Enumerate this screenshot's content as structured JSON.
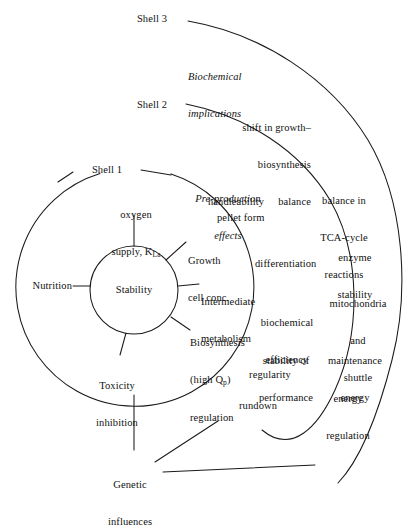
{
  "diagram": {
    "type": "concentric-shell-diagram",
    "stroke_color": "#1a1a1a",
    "background_color": "#ffffff",
    "core": {
      "label": "Stability"
    },
    "shells": [
      {
        "name": "shell-1",
        "label": "Shell 1"
      },
      {
        "name": "shell-2",
        "label": "Shell 2"
      },
      {
        "name": "shell-3",
        "label": "Shell 3"
      }
    ],
    "shell_titles": [
      {
        "name": "pre-production-effects",
        "line1": "Pre-production",
        "line2": "effects",
        "italic": true
      },
      {
        "name": "biochemical-implications",
        "line1": "Biochemical",
        "line2": "implications",
        "italic": true
      }
    ],
    "core_spokes": [
      {
        "name": "oxygen-supply",
        "line1": "oxygen",
        "line2": "supply, K",
        "sub": "La"
      },
      {
        "name": "growth-cell-conc",
        "line1": "Growth",
        "line2": "cell conc."
      },
      {
        "name": "intermediate-metabolism",
        "line1": "Intermediate",
        "line2": "metabolism"
      },
      {
        "name": "biosynthesis-regulation",
        "line1": "Biosynthesis",
        "line2": "(high Q",
        "sub": "p",
        "line2b": ")",
        "line3": "regulation"
      },
      {
        "name": "toxicity-inhibition",
        "line1": "Toxicity",
        "line2": "inhibition"
      },
      {
        "name": "nutrition",
        "line1": "Nutrition"
      },
      {
        "name": "genetic-influences",
        "line1": "Genetic",
        "line2": "influences"
      }
    ],
    "shell1_items": [
      {
        "name": "handleability",
        "text": "handleability"
      },
      {
        "name": "pellet-form",
        "text": "pellet form"
      },
      {
        "name": "differentiation",
        "text": "differentiation"
      },
      {
        "name": "biochemical-efficiency",
        "line1": "biochemical",
        "line2": "efficiency"
      },
      {
        "name": "stability-of-performance",
        "line1": "stability of",
        "line2": "performance"
      },
      {
        "name": "regularity",
        "text": "regularity"
      },
      {
        "name": "rundown",
        "text": "rundown"
      }
    ],
    "shell2_items": [
      {
        "name": "shift-in-growth-biosynthesis-balance",
        "line1": "shift in growth–",
        "line2": "biosynthesis",
        "line3": "balance"
      },
      {
        "name": "balance-in-tca-cycle-reactions",
        "line1": "balance in",
        "line2": "TCA-cycle",
        "line3": "reactions"
      },
      {
        "name": "enzyme-stability",
        "line1": "enzyme",
        "line2": "stability"
      },
      {
        "name": "mitochondria-and-shuttle",
        "line1": "mitochondria",
        "line2": "and",
        "line3": "shuttle"
      },
      {
        "name": "maintenance-energy",
        "line1": "maintenance",
        "line2": "energy"
      },
      {
        "name": "energy-regulation",
        "line1": "energy",
        "line2": "regulation"
      }
    ]
  }
}
